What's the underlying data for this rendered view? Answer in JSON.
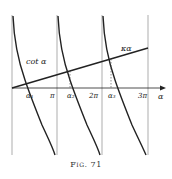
{
  "figure": {
    "caption": "Fig. 71",
    "curve_label": "cot α",
    "line_label": "κα",
    "axis_label": "α",
    "ticks": [
      "π",
      "2π",
      "3π"
    ],
    "roots": [
      "α₁",
      "α₂",
      "α₃"
    ]
  },
  "colors": {
    "ink": "#222222",
    "grid": "#888888",
    "background": "#ffffff"
  }
}
